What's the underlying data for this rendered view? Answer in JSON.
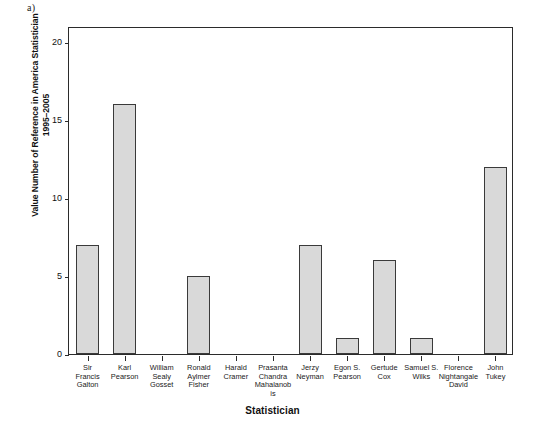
{
  "panel": {
    "letter": "a)"
  },
  "axes": {
    "xlabel": "Statistician",
    "ylabel_line1": "Value Number of Reference in America Statistician",
    "ylabel_line2": "1995–2005",
    "yticks": [
      "0",
      "5",
      "10",
      "15",
      "20"
    ]
  },
  "chart_data": {
    "type": "bar",
    "title": "",
    "subtitle": "",
    "xlabel": "Statistician",
    "ylabel": "Value Number of Reference in America Statistician 1995–2005",
    "ylim": [
      0,
      21
    ],
    "ytick_values": [
      0,
      5,
      10,
      15,
      20
    ],
    "grid": false,
    "legend": false,
    "bar_color": "#d9d9d9",
    "bar_edge_color": "#3a3a3a",
    "categories": [
      "Sir Francis Galton",
      "Karl Pearson",
      "William Sealy Gosset",
      "Ronald Aylmer Fisher",
      "Harald Cramer",
      "Prasanta Chandra Mahalanob is",
      "Jerzy Neyman",
      "Egon S. Pearson",
      "Gertude Cox",
      "Samuel S. Wilks",
      "Florence Nightangale David",
      "John Tukey"
    ],
    "values": [
      7,
      16,
      0,
      5,
      0,
      0,
      7,
      1,
      6,
      1,
      0,
      12
    ]
  },
  "categories_display": [
    "Sir\nFrancis\nGalton",
    "Karl\nPearson",
    "William\nSealy\nGosset",
    "Ronald\nAylmer\nFisher",
    "Harald\nCramer",
    "Prasanta\nChandra\nMahalanob\nis",
    "Jerzy\nNeyman",
    "Egon S.\nPearson",
    "Gertude\nCox",
    "Samuel S.\nWilks",
    "Florence\nNightangale\nDavid",
    "John\nTukey"
  ]
}
